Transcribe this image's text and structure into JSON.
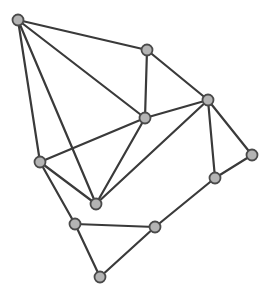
{
  "diagram": {
    "type": "undirected-graph",
    "width": 269,
    "height": 299,
    "colors": {
      "background": "#ffffff",
      "edge": "#3a3a3a",
      "node_fill": "#b4b4b4",
      "node_stroke": "#4a4a4a"
    },
    "node_radius": 5.5,
    "nodes": [
      {
        "id": "A",
        "x": 18,
        "y": 20
      },
      {
        "id": "B",
        "x": 147,
        "y": 50
      },
      {
        "id": "C",
        "x": 208,
        "y": 100
      },
      {
        "id": "D",
        "x": 145,
        "y": 118
      },
      {
        "id": "E",
        "x": 40,
        "y": 162
      },
      {
        "id": "F",
        "x": 96,
        "y": 204
      },
      {
        "id": "G",
        "x": 252,
        "y": 155
      },
      {
        "id": "H",
        "x": 215,
        "y": 178
      },
      {
        "id": "I",
        "x": 75,
        "y": 224
      },
      {
        "id": "J",
        "x": 155,
        "y": 227
      },
      {
        "id": "K",
        "x": 100,
        "y": 277
      }
    ],
    "edges": [
      [
        "A",
        "B"
      ],
      [
        "A",
        "D"
      ],
      [
        "A",
        "E"
      ],
      [
        "A",
        "F"
      ],
      [
        "B",
        "D"
      ],
      [
        "B",
        "C"
      ],
      [
        "C",
        "D"
      ],
      [
        "C",
        "F"
      ],
      [
        "C",
        "H"
      ],
      [
        "C",
        "G"
      ],
      [
        "D",
        "E"
      ],
      [
        "D",
        "F"
      ],
      [
        "E",
        "F"
      ],
      [
        "E",
        "I"
      ],
      [
        "G",
        "H"
      ],
      [
        "H",
        "J"
      ],
      [
        "I",
        "J"
      ],
      [
        "I",
        "K"
      ],
      [
        "J",
        "K"
      ]
    ]
  }
}
